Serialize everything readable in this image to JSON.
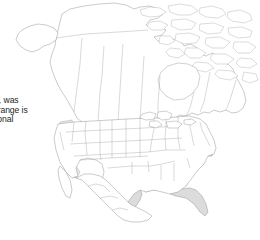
{
  "figure": {
    "kind": "range-map",
    "region": "North America",
    "projection_look": "conic",
    "caption_text_visible": false
  },
  "body_text": {
    "clipped_left": true,
    "lines": [
      {
        "italic_prefix": "scrofa,",
        "rest": " was"
      },
      {
        "italic_prefix": "",
        "rest": "its range is"
      },
      {
        "italic_prefix": "",
        "rest": "Regional"
      },
      {
        "italic_prefix": "",
        "rest": "e."
      }
    ]
  },
  "map": {
    "background_color": "#ffffff",
    "coastline_color": "#8a8a8a",
    "subdivision_color": "#9a9a9a",
    "range_fill_color": "#dcdcdc",
    "secondary_fill_color": "#e8e8e8",
    "countries": [
      "Canada",
      "United States",
      "Mexico"
    ],
    "shaded_regions_meaning": "species range",
    "shaded_states": [
      "Texas",
      "Oklahoma",
      "Louisiana",
      "Arkansas",
      "Mississippi",
      "Alabama",
      "Georgia",
      "Florida",
      "South Carolina",
      "North Carolina",
      "Tennessee",
      "California"
    ]
  }
}
